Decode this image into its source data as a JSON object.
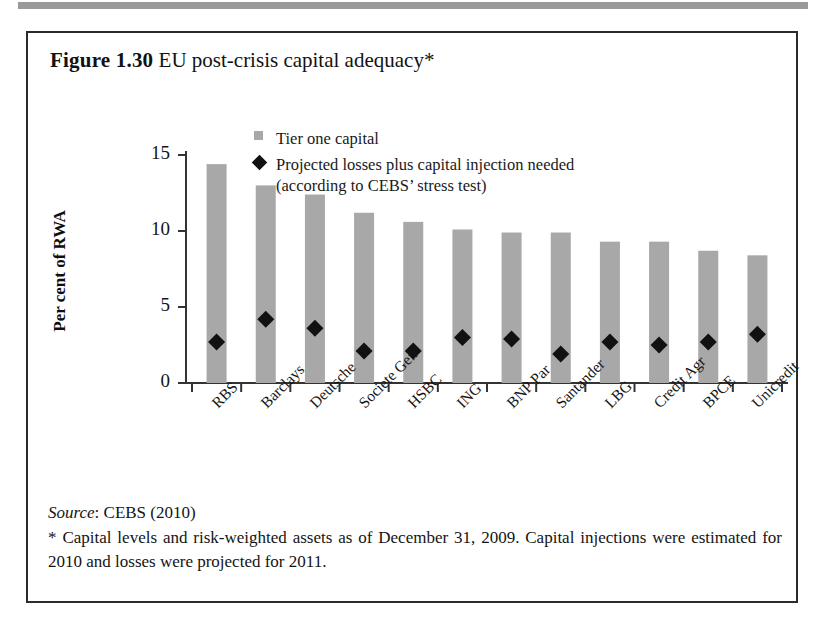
{
  "figure": {
    "caption_number": "Figure 1.30",
    "caption_title": "EU post-crisis capital adequacy*"
  },
  "legend": {
    "items": [
      {
        "marker": "square-swatch-icon",
        "label": "Tier one capital"
      },
      {
        "marker": "diamond-marker-icon",
        "label": "Projected losses plus capital injection needed",
        "label_line2": "(according to CEBS’ stress test)"
      }
    ]
  },
  "axes": {
    "y_title": "Per cent of RWA",
    "y_ticks": [
      "0",
      "5",
      "10",
      "15"
    ]
  },
  "footer": {
    "source_word": "Source",
    "source_rest": ": CEBS (2010)",
    "footnote": "* Capital levels and risk-weighted assets as of December 31, 2009. Capital injections were estimated for 2010 and losses were projected for 2011."
  },
  "colors": {
    "bar_fill": "#a8a8a8",
    "marker_fill": "#111111",
    "axis": "#333333",
    "frame": "#2b2b2b",
    "text": "#141414"
  },
  "chart_data": {
    "type": "bar",
    "title": "EU post-crisis capital adequacy*",
    "xlabel": "",
    "ylabel": "Per cent of RWA",
    "ylim": [
      0,
      15
    ],
    "yticks": [
      0,
      5,
      10,
      15
    ],
    "grid": false,
    "legend_position": "top-center",
    "categories": [
      "RBS",
      "Barclays",
      "Deutsche",
      "Societe Gen",
      "HSBC",
      "ING",
      "BNP Par",
      "Santander",
      "LBG",
      "Credit Agr",
      "BPCE",
      "Unicredit"
    ],
    "series": [
      {
        "name": "Tier one capital",
        "type": "bar",
        "values": [
          14.4,
          13.0,
          12.4,
          11.2,
          10.6,
          10.1,
          9.9,
          9.9,
          9.3,
          9.3,
          8.7,
          8.4
        ]
      },
      {
        "name": "Projected losses plus capital injection needed (according to CEBS’ stress test)",
        "type": "scatter",
        "marker": "diamond",
        "values": [
          2.7,
          4.2,
          3.6,
          2.1,
          2.1,
          3.0,
          2.9,
          1.9,
          2.7,
          2.5,
          2.7,
          3.2
        ]
      }
    ]
  }
}
